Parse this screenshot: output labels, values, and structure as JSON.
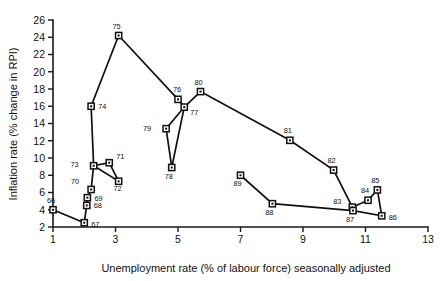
{
  "chart_data": {
    "type": "scatter",
    "title": "",
    "subtitle": "",
    "xlabel": "Unemployment rate (% of labour force) seasonally adjusted",
    "ylabel": "Inflation rate (% change in RPI)",
    "xlim": [
      1,
      13
    ],
    "ylim": [
      2,
      26
    ],
    "xticks": [
      1,
      3,
      5,
      7,
      9,
      11,
      13
    ],
    "xtick_labels": [
      "1",
      "3",
      "5",
      "7",
      "9",
      "11",
      "13"
    ],
    "yticks": [
      2,
      4,
      6,
      8,
      10,
      12,
      14,
      16,
      18,
      20,
      22,
      24,
      26
    ],
    "ytick_labels": [
      "2",
      "4",
      "6",
      "8",
      "10",
      "12",
      "14",
      "16",
      "18",
      "20",
      "22",
      "24",
      "26"
    ],
    "grid": false,
    "legend": "none",
    "marker": "open-square",
    "connected": true,
    "series": [
      {
        "name": "UK Phillips curve 1966-1989",
        "points": [
          {
            "label": "66",
            "x": 1.0,
            "y": 4.0,
            "lx": -2,
            "ly": -7
          },
          {
            "label": "67",
            "x": 2.0,
            "y": 2.5,
            "lx": 7,
            "ly": 4
          },
          {
            "label": "68",
            "x": 2.08,
            "y": 4.5,
            "lx": 7,
            "ly": 3
          },
          {
            "label": "69",
            "x": 2.1,
            "y": 5.4,
            "lx": 7,
            "ly": 3
          },
          {
            "label": "70",
            "x": 2.22,
            "y": 6.35,
            "lx": -12,
            "ly": -5
          },
          {
            "label": "71",
            "x": 2.8,
            "y": 9.45,
            "lx": 7,
            "ly": -4
          },
          {
            "label": "72",
            "x": 3.1,
            "y": 7.3,
            "lx": -1,
            "ly": 10
          },
          {
            "label": "73",
            "x": 2.3,
            "y": 9.1,
            "lx": -15,
            "ly": 1
          },
          {
            "label": "74",
            "x": 2.22,
            "y": 16.0,
            "lx": 7,
            "ly": 3
          },
          {
            "label": "75",
            "x": 3.1,
            "y": 24.2,
            "lx": -2,
            "ly": -7
          },
          {
            "label": "76",
            "x": 5.0,
            "y": 16.8,
            "lx": -1,
            "ly": -7
          },
          {
            "label": "77",
            "x": 5.2,
            "y": 15.9,
            "lx": 6,
            "ly": 8
          },
          {
            "label": "78",
            "x": 4.8,
            "y": 8.9,
            "lx": -3,
            "ly": 12
          },
          {
            "label": "79",
            "x": 4.62,
            "y": 13.4,
            "lx": -15,
            "ly": 2
          },
          {
            "label": "80",
            "x": 5.72,
            "y": 17.7,
            "lx": -2,
            "ly": -7
          },
          {
            "label": "81",
            "x": 8.58,
            "y": 12.05,
            "lx": -2,
            "ly": -7
          },
          {
            "label": "82",
            "x": 9.98,
            "y": 8.6,
            "lx": -2,
            "ly": -7
          },
          {
            "label": "83",
            "x": 10.58,
            "y": 4.3,
            "lx": -11,
            "ly": -3
          },
          {
            "label": "84",
            "x": 11.08,
            "y": 5.1,
            "lx": -3,
            "ly": -7
          },
          {
            "label": "85",
            "x": 11.38,
            "y": 6.3,
            "lx": -2,
            "ly": -7
          },
          {
            "label": "86",
            "x": 11.52,
            "y": 3.3,
            "lx": 7,
            "ly": 4
          },
          {
            "label": "87",
            "x": 10.6,
            "y": 3.9,
            "lx": -3,
            "ly": 11
          },
          {
            "label": "88",
            "x": 8.02,
            "y": 4.7,
            "lx": -3,
            "ly": 11
          },
          {
            "label": "89",
            "x": 7.0,
            "y": 8.0,
            "lx": -3,
            "ly": 11
          }
        ],
        "path_order": [
          "66",
          "67",
          "68",
          "69",
          "70",
          "73",
          "71",
          "72",
          "73",
          "74",
          "75",
          "76",
          "77",
          "79",
          "78",
          "77",
          "80",
          "81",
          "82",
          "83",
          "84",
          "85",
          "86",
          "87",
          "88",
          "89"
        ]
      }
    ]
  }
}
